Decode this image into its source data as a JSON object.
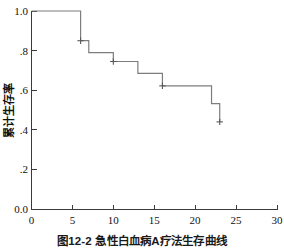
{
  "figure": {
    "caption": "图12-2  急性白血病A疗法生存曲线"
  },
  "chart_data": {
    "type": "line",
    "subtype": "kaplan-meier-step",
    "title": "",
    "subtitle": "",
    "xlabel": "",
    "ylabel": "累计生存率",
    "xlim": [
      0,
      30
    ],
    "ylim": [
      0.0,
      1.0
    ],
    "grid": false,
    "legend": null,
    "x_ticks": [
      0,
      5,
      10,
      15,
      20,
      25,
      30
    ],
    "x_tick_labels": [
      "0",
      "5",
      "10",
      "15",
      "20",
      "25",
      "30"
    ],
    "y_ticks": [
      0.0,
      0.2,
      0.4,
      0.6,
      0.8,
      1.0
    ],
    "y_tick_labels": [
      "0.0",
      ".2",
      ".4",
      ".6",
      ".8",
      "1.0"
    ],
    "series": [
      {
        "name": "累计生存率",
        "color": "#7d7d7d",
        "steps": [
          {
            "x": 0,
            "y": 1.0
          },
          {
            "x": 6,
            "y": 1.0
          },
          {
            "x": 6,
            "y": 0.85
          },
          {
            "x": 7,
            "y": 0.85
          },
          {
            "x": 7,
            "y": 0.79
          },
          {
            "x": 10,
            "y": 0.79
          },
          {
            "x": 10,
            "y": 0.745
          },
          {
            "x": 13,
            "y": 0.745
          },
          {
            "x": 13,
            "y": 0.685
          },
          {
            "x": 16,
            "y": 0.685
          },
          {
            "x": 16,
            "y": 0.622
          },
          {
            "x": 22,
            "y": 0.622
          },
          {
            "x": 22,
            "y": 0.532
          },
          {
            "x": 23,
            "y": 0.532
          },
          {
            "x": 23,
            "y": 0.44
          }
        ],
        "censor_points": [
          {
            "x": 6,
            "y": 0.85
          },
          {
            "x": 10,
            "y": 0.745
          },
          {
            "x": 16,
            "y": 0.622
          },
          {
            "x": 23,
            "y": 0.44
          }
        ]
      }
    ]
  }
}
